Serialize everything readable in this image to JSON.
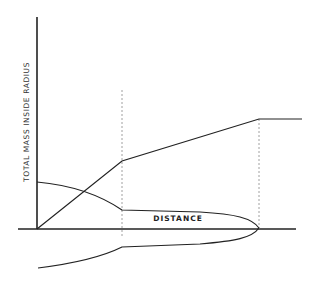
{
  "diagram": {
    "ylabel": "TOTAL MASS INSIDE RADIUS",
    "xlabel": "DISTANCE",
    "colors": {
      "line": "#222222",
      "dashed": "#888888",
      "background": "#ffffff"
    }
  }
}
